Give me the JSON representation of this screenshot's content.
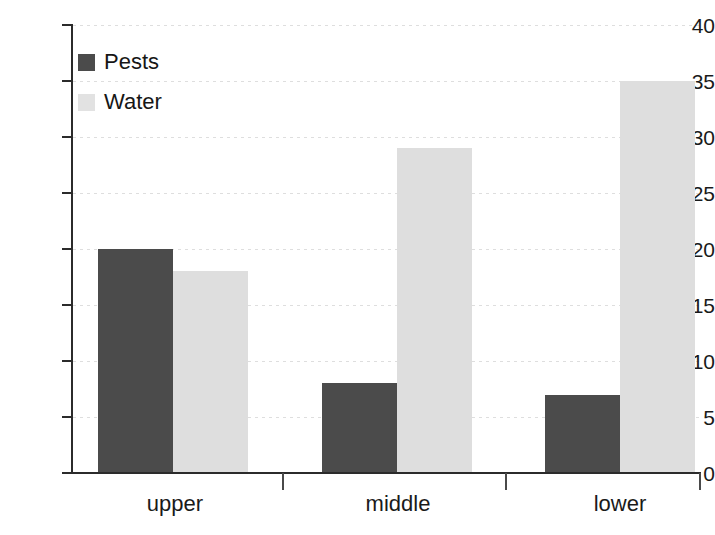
{
  "chart_data": {
    "type": "bar",
    "title": "",
    "xlabel": "",
    "ylabel": "",
    "categories": [
      "upper",
      "middle",
      "lower"
    ],
    "series": [
      {
        "name": "Pests",
        "color": "#4b4b4b",
        "values": [
          20,
          8,
          7
        ]
      },
      {
        "name": "Water",
        "color": "#dedede",
        "values": [
          18,
          29,
          35
        ]
      }
    ],
    "ylim": [
      0,
      40
    ],
    "ytick_values": [
      0,
      5,
      10,
      15,
      20,
      25,
      30,
      35,
      40
    ],
    "ytick_labels": [
      "0",
      "5",
      "10",
      "15",
      "20",
      "25",
      "30",
      "35",
      "40"
    ],
    "grid": true,
    "grid_axis": "y",
    "legend_position": "upper left",
    "legend": [
      "Pests",
      "Water"
    ],
    "background": "#ffffff",
    "axis_color": "#2b2b2b"
  },
  "legend": {
    "items": [
      {
        "label": "Pests"
      },
      {
        "label": "Water"
      }
    ]
  },
  "axis": {
    "y_labels": [
      "40",
      "35",
      "30",
      "25",
      "20",
      "15",
      "10",
      "5",
      "0"
    ],
    "x_labels": [
      "upper",
      "middle",
      "lower"
    ]
  }
}
